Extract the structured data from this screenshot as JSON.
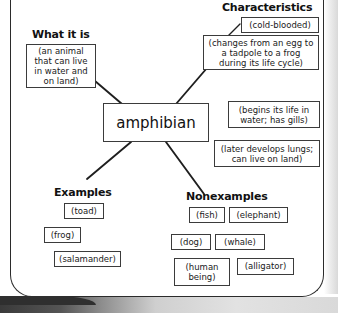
{
  "diagram": {
    "center_term": "amphibian",
    "sections": [
      {
        "id": "what-it-is",
        "heading": "What it is",
        "items": [
          "(an animal that can live in water and on land)"
        ]
      },
      {
        "id": "characteristics",
        "heading": "Characteristics",
        "items": [
          "(cold-blooded)",
          "(changes from an egg to a tadpole to a frog during its life cycle)",
          "(begins its life in water; has gills)",
          "(later develops lungs; can live on land)"
        ]
      },
      {
        "id": "examples",
        "heading": "Examples",
        "items": [
          "(toad)",
          "(frog)",
          "(salamander)"
        ]
      },
      {
        "id": "nonexamples",
        "heading": "Nonexamples",
        "items": [
          "(fish)",
          "(elephant)",
          "(dog)",
          "(whale)",
          "(human being)",
          "(alligator)"
        ]
      }
    ]
  },
  "headings": {
    "what_it_is": "What it is",
    "characteristics": "Characteristics",
    "examples": "Examples",
    "nonexamples": "Nonexamples"
  },
  "boxes": {
    "center": "amphibian",
    "definition": "(an animal that can live in water and on land)",
    "cold_blooded": "(cold-blooded)",
    "life_cycle": "(changes from an egg to a tadpole to a frog during its life cycle)",
    "gills": "(begins its life in water; has gills)",
    "lungs": "(later develops lungs; can live on land)",
    "toad": "(toad)",
    "frog": "(frog)",
    "salamander": "(salamander)",
    "fish": "(fish)",
    "elephant": "(elephant)",
    "dog": "(dog)",
    "whale": "(whale)",
    "human_being": "(human being)",
    "alligator": "(alligator)"
  },
  "colors": {
    "ink": "#1a1a1a",
    "border": "#3b3b3b",
    "paper": "#ffffff",
    "page_edge": "#d2d2d2"
  }
}
